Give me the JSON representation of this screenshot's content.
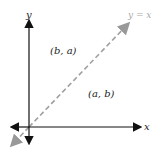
{
  "diagram": {
    "y_axis_label": "y",
    "x_axis_label": "x",
    "line_label": "y = x",
    "point_above": "(b, a)",
    "point_below": "(a, b)",
    "colors": {
      "axes": "#111111",
      "line": "#a0a0a0",
      "text": "#222222"
    }
  }
}
